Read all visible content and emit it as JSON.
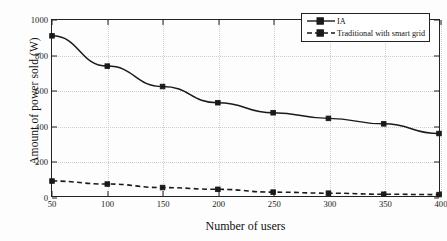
{
  "chart_data": {
    "type": "line",
    "title": "",
    "xlabel": "Number of users",
    "ylabel": "Amount of power sold (W)",
    "x": [
      50,
      100,
      150,
      200,
      250,
      300,
      350,
      400
    ],
    "xticklabels": [
      "50",
      "100",
      "150",
      "200",
      "250",
      "300",
      "350",
      "400"
    ],
    "yticklabels": [
      "0",
      "200",
      "400",
      "600",
      "800",
      "1000"
    ],
    "yticks": [
      0,
      200,
      400,
      600,
      800,
      1000
    ],
    "xlim": [
      50,
      400
    ],
    "ylim": [
      0,
      1000
    ],
    "grid": true,
    "legend_position": "top-right",
    "series": [
      {
        "name": "IA",
        "values": [
          910,
          738,
          622,
          530,
          473,
          441,
          410,
          355
        ],
        "line_style": "solid",
        "marker": "square-filled",
        "color": "#1a1a1a"
      },
      {
        "name": "Traditional with smart grid",
        "values": [
          85,
          68,
          48,
          38,
          22,
          16,
          10,
          8
        ],
        "line_style": "dashed",
        "marker": "square-filled",
        "color": "#1a1a1a"
      }
    ]
  },
  "legend": {
    "items": [
      {
        "label": "IA"
      },
      {
        "label": "Traditional with smart grid"
      }
    ]
  },
  "axes": {
    "x_title": "Number of users",
    "y_title": "Amount of power sold (W)"
  }
}
